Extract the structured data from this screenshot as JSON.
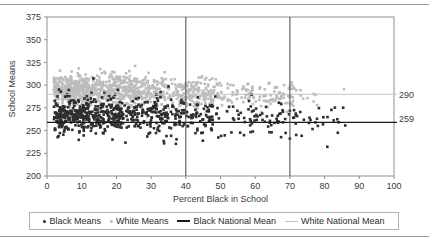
{
  "chart_data": {
    "type": "scatter",
    "title": "",
    "xlabel": "Percent Black in School",
    "ylabel": "School Means",
    "xlim": [
      0,
      100
    ],
    "ylim": [
      200,
      375
    ],
    "xticks": [
      0,
      10,
      20,
      30,
      40,
      50,
      60,
      70,
      80,
      90,
      100
    ],
    "yticks": [
      200,
      225,
      250,
      275,
      300,
      325,
      350,
      375
    ],
    "grid": false,
    "legend_position": "bottom",
    "series": [
      {
        "name": "Black Means",
        "marker": "dot",
        "color": "#2b2b2b",
        "description": "School mean scores for black students, plotted against percent black enrollment; dense cloud centered near 255-270 spanning 0-87 percent black."
      },
      {
        "name": "White Means",
        "marker": "dot",
        "color": "#b9b9b9",
        "description": "School mean scores for white students; dense cloud centered near 285-300, concentrated from 0-75 percent black."
      }
    ],
    "reference_lines": [
      {
        "name": "Black National Mean",
        "orientation": "horizontal",
        "value": 259,
        "label": "259",
        "color": "#1a1a1a"
      },
      {
        "name": "White National Mean",
        "orientation": "horizontal",
        "value": 290,
        "label": "290",
        "color": "#c2c2c2"
      },
      {
        "name": "Vertical Marker 40",
        "orientation": "vertical",
        "value": 40,
        "label": "",
        "color": "#555555"
      },
      {
        "name": "Vertical Marker 70",
        "orientation": "vertical",
        "value": 70,
        "label": "",
        "color": "#555555"
      }
    ]
  },
  "legend": {
    "entries": [
      {
        "label": "Black Means",
        "marker": "dot",
        "style": "black"
      },
      {
        "label": "White Means",
        "marker": "dot",
        "style": "gray"
      },
      {
        "label": "Black National Mean",
        "marker": "line",
        "style": "black"
      },
      {
        "label": "White National Mean",
        "marker": "line",
        "style": "gray"
      }
    ]
  },
  "right_labels": {
    "white_mean": "290",
    "black_mean": "259"
  }
}
